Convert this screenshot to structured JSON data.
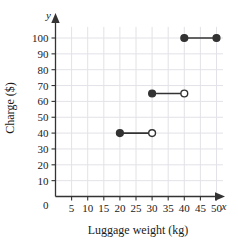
{
  "chart_data": {
    "type": "line",
    "title": "",
    "xlabel": "Luggage weight (kg)",
    "ylabel": "Charge ($)",
    "x_var_label": "x",
    "y_var_label": "y",
    "xlim": [
      0,
      52
    ],
    "ylim": [
      0,
      107
    ],
    "xticks": [
      5,
      10,
      15,
      20,
      25,
      30,
      35,
      40,
      45,
      50
    ],
    "yticks": [
      10,
      20,
      30,
      40,
      50,
      60,
      70,
      80,
      90,
      100
    ],
    "origin_label": "0",
    "grid": true,
    "legend": "none",
    "series": [
      {
        "name": "Charge step function",
        "style": "step",
        "segments": [
          {
            "y": 40,
            "x_start": 20,
            "x_end": 30,
            "start_marker": "closed",
            "end_marker": "open"
          },
          {
            "y": 65,
            "x_start": 30,
            "x_end": 40,
            "start_marker": "closed",
            "end_marker": "open"
          },
          {
            "y": 100,
            "x_start": 40,
            "x_end": 50,
            "start_marker": "closed",
            "end_marker": "closed"
          }
        ]
      }
    ],
    "colors": {
      "line": "#333333",
      "marker_fill": "#333333",
      "marker_open_fill": "#ffffff",
      "grid": "#e2e2e8",
      "axis": "#333333",
      "background": "#ffffff"
    }
  },
  "axis_tick_text": {
    "x": [
      "5",
      "10",
      "15",
      "20",
      "25",
      "30",
      "35",
      "40",
      "45",
      "50"
    ],
    "y": [
      "10",
      "20",
      "30",
      "40",
      "50",
      "60",
      "70",
      "80",
      "90",
      "100"
    ]
  }
}
